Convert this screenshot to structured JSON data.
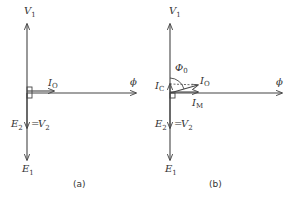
{
  "diagrams": [
    {
      "id": "a",
      "caption": "(a)",
      "labels": {
        "v1": "V",
        "v1_sub": "1",
        "i0": "I",
        "i0_sub": "O",
        "phi": "ϕ",
        "e2": "E",
        "e2_sub": "2",
        "eq": "=",
        "v2": "V",
        "v2_sub": "2",
        "e1": "E",
        "e1_sub": "1"
      }
    },
    {
      "id": "b",
      "caption": "(b)",
      "labels": {
        "v1": "V",
        "v1_sub": "1",
        "phi0": "Φ",
        "phi0_sub": "0",
        "ic": "I",
        "ic_sub": "C",
        "i0": "I",
        "i0_sub": "O",
        "im": "I",
        "im_sub": "M",
        "phi": "ϕ",
        "e2": "E",
        "e2_sub": "2",
        "eq": "=",
        "v2": "V",
        "v2_sub": "2",
        "e1": "E",
        "e1_sub": "1"
      }
    }
  ]
}
